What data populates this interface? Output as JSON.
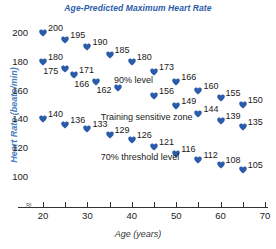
{
  "chart_data": {
    "type": "scatter",
    "title": "Age-Predicted Maximum Heart Rate",
    "xlabel": "Age (years)",
    "ylabel": "Heart Rate (beats/min)",
    "xlim": [
      18,
      71
    ],
    "ylim": [
      95,
      208
    ],
    "grid": false,
    "legend": null,
    "axis_break": "≈",
    "marker_shape": "heart",
    "marker_color": "#2a5caa",
    "x_ticks": [
      20,
      25,
      30,
      35,
      40,
      45,
      50,
      55,
      60,
      65,
      70
    ],
    "x_tick_labels": [
      "20",
      "",
      "30",
      "",
      "40",
      "",
      "50",
      "",
      "60",
      "",
      "70"
    ],
    "y_ticks": [
      100,
      120,
      140,
      160,
      180,
      200
    ],
    "y_tick_labels": [
      "100",
      "120",
      "140",
      "160",
      "180",
      "200"
    ],
    "x": [
      20,
      20,
      20,
      25,
      25,
      25,
      30,
      30,
      30,
      35,
      35,
      35,
      40,
      40,
      40,
      45,
      45,
      45,
      50,
      50,
      50,
      55,
      55,
      55,
      60,
      60,
      60,
      65,
      65,
      65
    ],
    "y": [
      200,
      180,
      140,
      195,
      171,
      136,
      190,
      166,
      133,
      185,
      162,
      129,
      180,
      156,
      126,
      173,
      149,
      121,
      166,
      144,
      116,
      160,
      139,
      112,
      155,
      135,
      108,
      150,
      130,
      105
    ],
    "points": [
      {
        "x": 20,
        "y": 200,
        "label": "200"
      },
      {
        "x": 20,
        "y": 180,
        "label": "180"
      },
      {
        "x": 20,
        "y": 140,
        "label": "140"
      },
      {
        "x": 25,
        "y": 195,
        "label": "195"
      },
      {
        "x": 25,
        "y": 175,
        "label": "175"
      },
      {
        "x": 25,
        "y": 136,
        "label": "136"
      },
      {
        "x": 27,
        "y": 171,
        "label": "171"
      },
      {
        "x": 30,
        "y": 190,
        "label": "190"
      },
      {
        "x": 32,
        "y": 166,
        "label": "166"
      },
      {
        "x": 30,
        "y": 133,
        "label": "133"
      },
      {
        "x": 35,
        "y": 185,
        "label": "185"
      },
      {
        "x": 37,
        "y": 162,
        "label": "162"
      },
      {
        "x": 35,
        "y": 129,
        "label": "129"
      },
      {
        "x": 40,
        "y": 180,
        "label": "180"
      },
      {
        "x": 40,
        "y": 126,
        "label": "126"
      },
      {
        "x": 45,
        "y": 173,
        "label": "173"
      },
      {
        "x": 45,
        "y": 156,
        "label": "156"
      },
      {
        "x": 45,
        "y": 121,
        "label": "121"
      },
      {
        "x": 50,
        "y": 166,
        "label": "166"
      },
      {
        "x": 50,
        "y": 149,
        "label": "149"
      },
      {
        "x": 50,
        "y": 116,
        "label": "116"
      },
      {
        "x": 55,
        "y": 160,
        "label": "160"
      },
      {
        "x": 55,
        "y": 144,
        "label": "144"
      },
      {
        "x": 55,
        "y": 112,
        "label": "112"
      },
      {
        "x": 60,
        "y": 155,
        "label": "155"
      },
      {
        "x": 60,
        "y": 139,
        "label": "139"
      },
      {
        "x": 60,
        "y": 108,
        "label": "108"
      },
      {
        "x": 65,
        "y": 150,
        "label": "150"
      },
      {
        "x": 65,
        "y": 135,
        "label": "135"
      },
      {
        "x": 65,
        "y": 105,
        "label": "105"
      }
    ],
    "annotations": [
      {
        "text": "90% level",
        "x": 36,
        "y": 167
      },
      {
        "text": "Training sensitive zone",
        "x": 33,
        "y": 141
      },
      {
        "text": "70% threshold level",
        "x": 33,
        "y": 113
      }
    ],
    "colors": {
      "marker": "#2a5caa",
      "title": "#2a5caa",
      "y_axis_label": "#4a7fc1",
      "x_axis_label": "#333333",
      "tick_text": "#1a1a1a",
      "axis_line": "#333333",
      "background": "#ffffff"
    }
  }
}
